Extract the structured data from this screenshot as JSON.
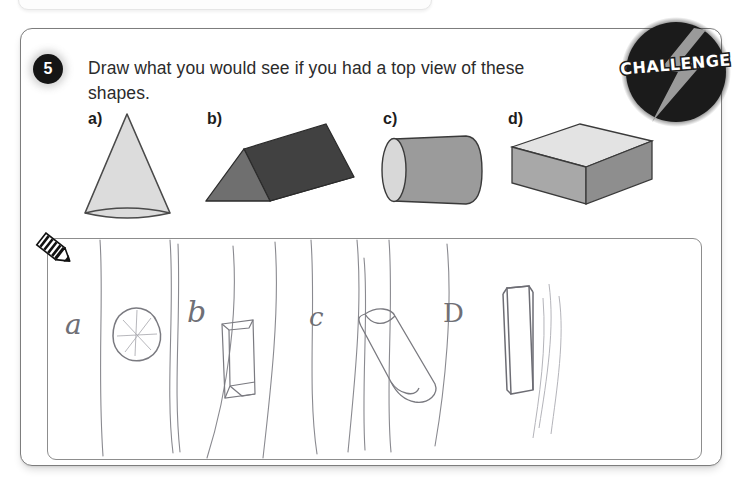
{
  "page": {
    "background_color": "#ffffff",
    "card_border_color": "#7d7d7d"
  },
  "top_strip": {
    "dots": "· · ·  · · ·"
  },
  "question": {
    "number": "5",
    "text": "Draw what you would see if you had a top view of these shapes."
  },
  "badge": {
    "label": "CHALLENGE",
    "circle_color": "#1b1b1b",
    "bolt_color": "#9a9a9a",
    "text_color": "#ffffff"
  },
  "shapes": [
    {
      "key": "a",
      "label": "a)",
      "name": "cone",
      "fill": "#dcdcdc",
      "stroke": "#4a4a4a"
    },
    {
      "key": "b",
      "label": "b)",
      "name": "triangular-prism",
      "fill_top": "#414141",
      "fill_side": "#6f6f6f",
      "stroke": "#2b2b2b"
    },
    {
      "key": "c",
      "label": "c)",
      "name": "cylinder",
      "fill_body": "#9b9b9b",
      "fill_end": "#d8d8d8",
      "stroke": "#3a3a3a"
    },
    {
      "key": "d",
      "label": "d)",
      "name": "rectangular-prism",
      "fill_top": "#e3e3e3",
      "fill_front": "#a8a8a8",
      "fill_side": "#8e8e8e",
      "stroke": "#3a3a3a"
    }
  ],
  "answer_area": {
    "icon": "pencil-icon",
    "handwritten_labels": [
      "a",
      "b",
      "c",
      "D"
    ],
    "handwritten_answers": [
      "circle with radial lines (top view of cone)",
      "narrow rectangle outline (top view of triangular prism)",
      "rounded rectangle / cylinder outline (top view of cylinder)",
      "long narrow rectangle (top view of rectangular prism)"
    ],
    "border_color": "#8d8d8d"
  }
}
